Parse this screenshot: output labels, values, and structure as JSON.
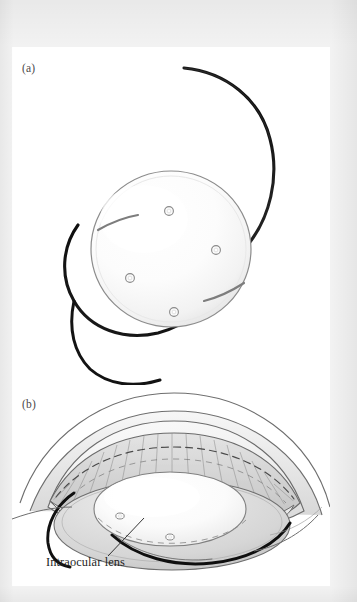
{
  "figure": {
    "kind": "anatomical-illustration",
    "background_color": "#f2f2f2",
    "paper_color": "#ffffff",
    "ink_color": "#1f1f1f"
  },
  "panels": [
    {
      "id": "a",
      "label": "(a)",
      "caption": "",
      "description": "Intraocular lens shown in isolation: round optic disc with four small positioning holes and two thin curved C-loop haptics.",
      "parts": {
        "optic_label": "optic",
        "haptic_label": "haptic",
        "positioning_hole_label": "positioning hole",
        "positioning_hole_count": 4
      }
    },
    {
      "id": "b",
      "label": "(b)",
      "caption": "",
      "description": "Cutaway cross-section of the anterior eye with the intraocular lens implanted in the capsular bag behind the iris.",
      "parts": {
        "cornea_label": "cornea",
        "iris_label": "iris",
        "pupil_label": "pupil",
        "sclera_label": "sclera",
        "capsular_bag_label": "capsular bag",
        "haptic_label": "haptic"
      }
    }
  ],
  "callouts": [
    {
      "id": "intraocular-lens",
      "text": "Intraocular lens",
      "leader_from": [
        105,
        554
      ],
      "leader_to": [
        140,
        519
      ]
    }
  ],
  "colors": {
    "ink": "#1f1f1f",
    "outline": "#5a5a5a",
    "haptic": "#161616",
    "label_grey": "#4a4a4a",
    "tissue_light": "#f1f1f1",
    "tissue_mid": "#d9d9d9",
    "tissue_dark": "#b4b4b4",
    "optic_fill": "#fdfdfd"
  }
}
